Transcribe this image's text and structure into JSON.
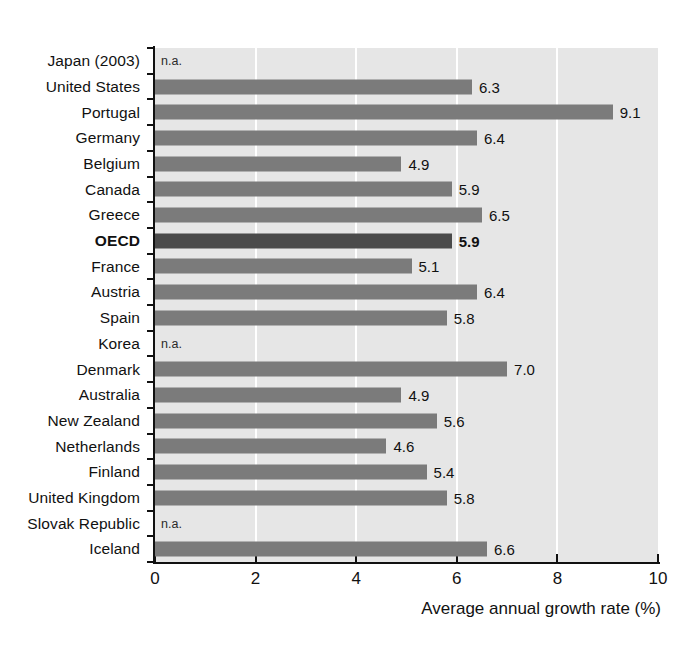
{
  "chart_data": {
    "type": "bar",
    "orientation": "horizontal",
    "title": "",
    "xlabel": "Average annual growth rate (%)",
    "ylabel": "",
    "xlim": [
      0,
      10
    ],
    "xticks": [
      "0",
      "2",
      "4",
      "6",
      "8",
      "10"
    ],
    "xtick_values": [
      0,
      2,
      4,
      6,
      8,
      10
    ],
    "grid": "vertical-white-gridlines-at-2-4-6-8",
    "legend": "none",
    "na_label": "n.a.",
    "highlight_category": "OECD",
    "colors": {
      "bar": "#7b7b7b",
      "bar_highlight": "#4b4b4b",
      "plot_background": "#e6e6e6",
      "gridline": "#ffffff",
      "axis": "#111111",
      "text": "#111111"
    },
    "categories": [
      "Japan (2003)",
      "United States",
      "Portugal",
      "Germany",
      "Belgium",
      "Canada",
      "Greece",
      "OECD",
      "France",
      "Austria",
      "Spain",
      "Korea",
      "Denmark",
      "Australia",
      "New Zealand",
      "Netherlands",
      "Finland",
      "United Kingdom",
      "Slovak Republic",
      "Iceland"
    ],
    "values": [
      null,
      6.3,
      9.1,
      6.4,
      4.9,
      5.9,
      6.5,
      5.9,
      5.1,
      6.4,
      5.8,
      null,
      7.0,
      4.9,
      5.6,
      4.6,
      5.4,
      5.8,
      null,
      6.6
    ],
    "value_labels": [
      "n.a.",
      "6.3",
      "9.1",
      "6.4",
      "4.9",
      "5.9",
      "6.5",
      "5.9",
      "5.1",
      "6.4",
      "5.8",
      "n.a.",
      "7.0",
      "4.9",
      "5.6",
      "4.6",
      "5.4",
      "5.8",
      "n.a.",
      "6.6"
    ],
    "rows": [
      {
        "label": "Japan (2003)",
        "value": null,
        "display": "n.a.",
        "na": true,
        "highlight": false
      },
      {
        "label": "United States",
        "value": 6.3,
        "display": "6.3",
        "na": false,
        "highlight": false
      },
      {
        "label": "Portugal",
        "value": 9.1,
        "display": "9.1",
        "na": false,
        "highlight": false
      },
      {
        "label": "Germany",
        "value": 6.4,
        "display": "6.4",
        "na": false,
        "highlight": false
      },
      {
        "label": "Belgium",
        "value": 4.9,
        "display": "4.9",
        "na": false,
        "highlight": false
      },
      {
        "label": "Canada",
        "value": 5.9,
        "display": "5.9",
        "na": false,
        "highlight": false
      },
      {
        "label": "Greece",
        "value": 6.5,
        "display": "6.5",
        "na": false,
        "highlight": false
      },
      {
        "label": "OECD",
        "value": 5.9,
        "display": "5.9",
        "na": false,
        "highlight": true
      },
      {
        "label": "France",
        "value": 5.1,
        "display": "5.1",
        "na": false,
        "highlight": false
      },
      {
        "label": "Austria",
        "value": 6.4,
        "display": "6.4",
        "na": false,
        "highlight": false
      },
      {
        "label": "Spain",
        "value": 5.8,
        "display": "5.8",
        "na": false,
        "highlight": false
      },
      {
        "label": "Korea",
        "value": null,
        "display": "n.a.",
        "na": true,
        "highlight": false
      },
      {
        "label": "Denmark",
        "value": 7.0,
        "display": "7.0",
        "na": false,
        "highlight": false
      },
      {
        "label": "Australia",
        "value": 4.9,
        "display": "4.9",
        "na": false,
        "highlight": false
      },
      {
        "label": "New Zealand",
        "value": 5.6,
        "display": "5.6",
        "na": false,
        "highlight": false
      },
      {
        "label": "Netherlands",
        "value": 4.6,
        "display": "4.6",
        "na": false,
        "highlight": false
      },
      {
        "label": "Finland",
        "value": 5.4,
        "display": "5.4",
        "na": false,
        "highlight": false
      },
      {
        "label": "United Kingdom",
        "value": 5.8,
        "display": "5.8",
        "na": false,
        "highlight": false
      },
      {
        "label": "Slovak Republic",
        "value": null,
        "display": "n.a.",
        "na": true,
        "highlight": false
      },
      {
        "label": "Iceland",
        "value": 6.6,
        "display": "6.6",
        "na": false,
        "highlight": false
      }
    ]
  }
}
